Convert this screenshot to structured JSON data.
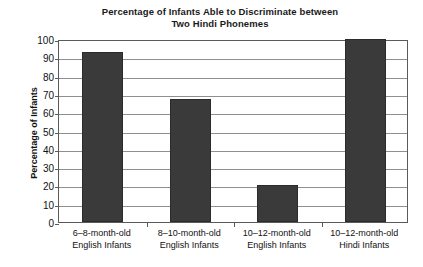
{
  "chart_data": {
    "type": "bar",
    "title": "Percentage of Infants Able to Discriminate between Two Hindi Phonemes",
    "title_line1": "Percentage of Infants Able to Discriminate between",
    "title_line2": "Two Hindi Phonemes",
    "xlabel": "",
    "ylabel": "Percentage of Infants",
    "ylim": [
      0,
      100
    ],
    "ytick_step": 10,
    "yticks": [
      100,
      90,
      80,
      70,
      60,
      50,
      40,
      30,
      20,
      10,
      0
    ],
    "grid": "horizontal",
    "legend": "none",
    "categories": [
      "6–8-month-old English Infants",
      "8–10-month-old English Infants",
      "10–12-month-old English Infants",
      "10–12-month-old Hindi Infants"
    ],
    "category_lines": [
      {
        "line1": "6–8-month-old",
        "line2": "English Infants"
      },
      {
        "line1": "8–10-month-old",
        "line2": "English Infants"
      },
      {
        "line1": "10–12-month-old",
        "line2": "English Infants"
      },
      {
        "line1": "10–12-month-old",
        "line2": "Hindi Infants"
      }
    ],
    "values": [
      93,
      67,
      20,
      100
    ],
    "bar_color": "#3a3a3a",
    "plot_border_color": "#5a5a5a",
    "gridline_color": "#8f8f8f",
    "background_color": "#ffffff"
  }
}
